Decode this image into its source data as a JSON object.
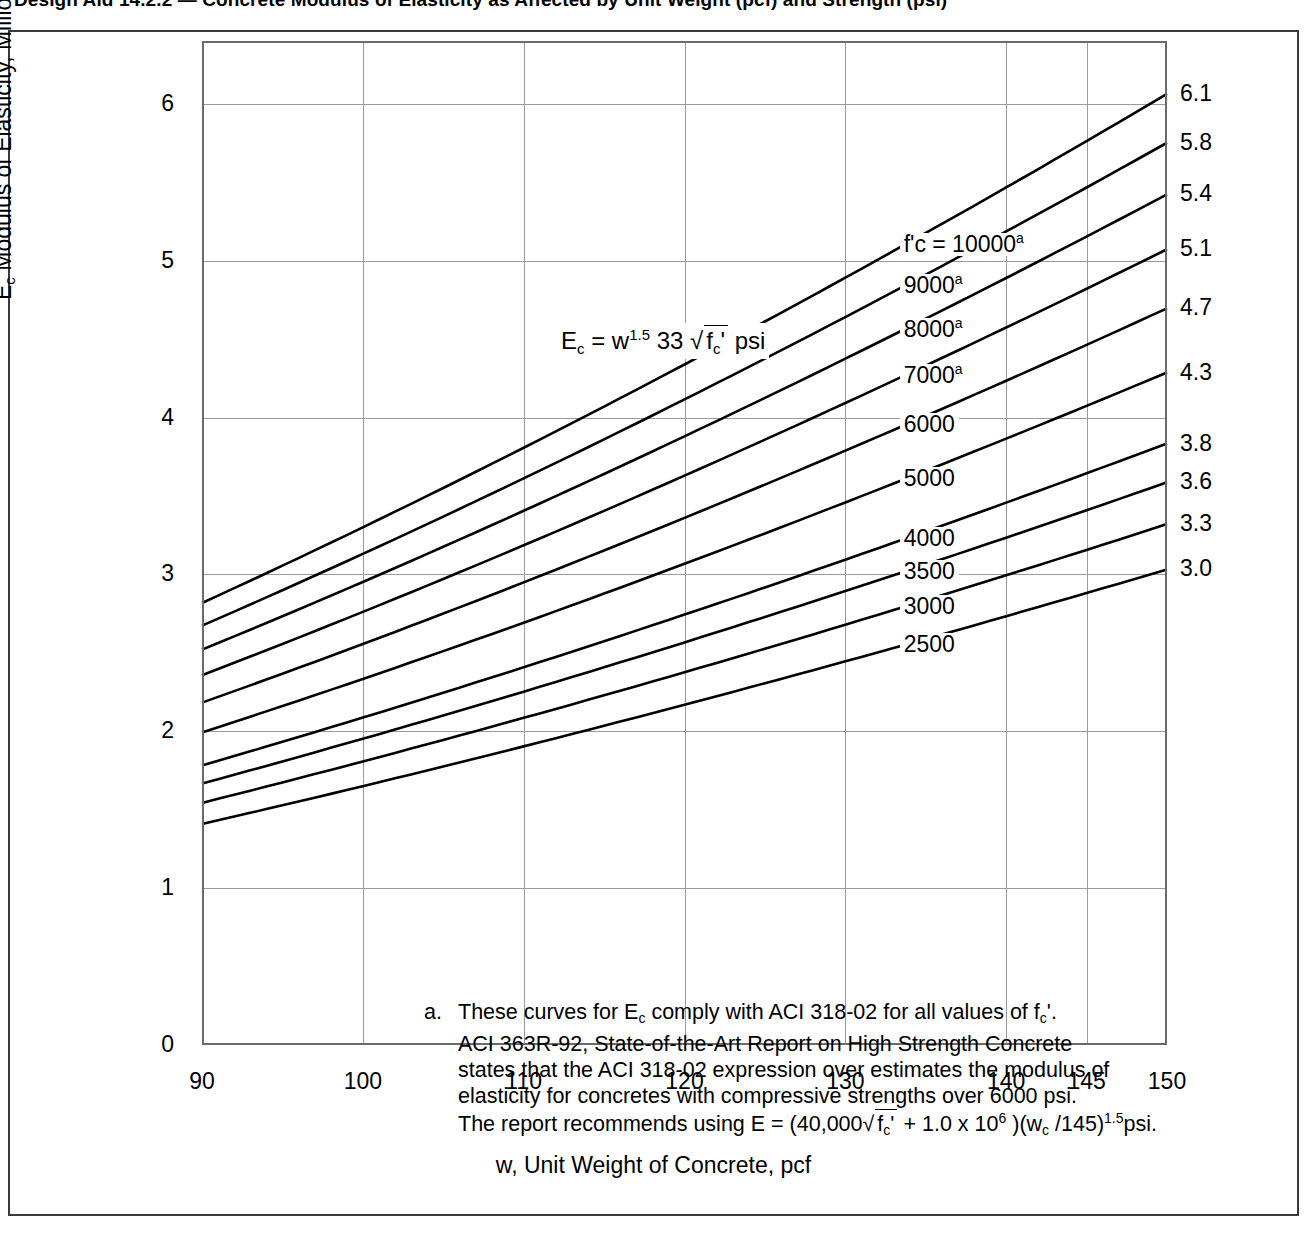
{
  "title": "Design Aid 14.2.2 — Concrete Modulus of Elasticity as Affected by Unit Weight (pcf) and Strength (psi)",
  "axes": {
    "xlabel": "w, Unit Weight of Concrete, pcf",
    "ylabel_prefix": "E",
    "ylabel_sub": "c",
    "ylabel_rest": "  Modulus of Elasticity, Million psi"
  },
  "equation": {
    "lhs": "E",
    "lhs_sub": "c",
    "eq": " = w",
    "w_exp": "1.5",
    "coef": " 33 ",
    "radicand_f": "f",
    "radicand_sub": "c",
    "radicand_prime": "'",
    "units": " psi"
  },
  "footnote": {
    "marker": "a.",
    "line1a": "These curves for E",
    "line1sub": "c",
    "line1b": " comply with ACI 318-02 for all values of f",
    "line1sub2": "c",
    "line1c": "'.",
    "line2": "ACI 363R-92, State-of-the-Art Report on High Strength Concrete",
    "line3": "states that the ACI 318-02 expression over estimates the modulus of",
    "line4": "elasticity for concretes with compressive strengths over 6000 psi.",
    "line5a": "The report recommends using E = (40,000",
    "line5f": "f",
    "line5fsub": "c",
    "line5fprime": "'",
    "line5b": " + 1.0 x 10",
    "line5exp": "6",
    "line5c": " )(w",
    "line5wsub": "c",
    "line5d": " /145)",
    "line5exp2": "1.5",
    "line5e": "psi."
  },
  "chart_data": {
    "type": "line",
    "title": "Concrete Modulus of Elasticity as Affected by Unit Weight (pcf) and Strength (psi)",
    "xlabel": "w, Unit Weight of Concrete, pcf",
    "ylabel": "Ec  Modulus of Elasticity, Million psi",
    "xlim": [
      90,
      150
    ],
    "ylim": [
      0,
      6.4
    ],
    "grid": true,
    "legend_position": "inline-right",
    "xticks": [
      90,
      100,
      110,
      120,
      130,
      140,
      145,
      150
    ],
    "xtick_labels": [
      "90",
      "100",
      "110",
      "120",
      "130",
      "140",
      "145",
      "150"
    ],
    "yticks": [
      0,
      1,
      2,
      3,
      4,
      5,
      6
    ],
    "ytick_labels": [
      "0",
      "1",
      "2",
      "3",
      "4",
      "5",
      "6"
    ],
    "formula": "Ec = w^1.5 * 33 * sqrt(f'c) psi",
    "x": [
      90,
      100,
      110,
      120,
      130,
      140,
      145,
      150
    ],
    "series": [
      {
        "name": "10000",
        "fc": 10000,
        "footnote": "a",
        "label": "f'c = 10000",
        "values": [
          2.82,
          3.3,
          3.81,
          4.34,
          4.89,
          5.47,
          5.76,
          6.06
        ],
        "end_value": "6.1"
      },
      {
        "name": "9000",
        "fc": 9000,
        "footnote": "a",
        "label": "9000",
        "values": [
          2.67,
          3.13,
          3.61,
          4.12,
          4.64,
          5.19,
          5.47,
          5.75
        ],
        "end_value": "5.8"
      },
      {
        "name": "8000",
        "fc": 8000,
        "footnote": "a",
        "label": "8000",
        "values": [
          2.52,
          2.95,
          3.41,
          3.88,
          4.38,
          4.89,
          5.15,
          5.42
        ],
        "end_value": "5.4"
      },
      {
        "name": "7000",
        "fc": 7000,
        "footnote": "a",
        "label": "7000",
        "values": [
          2.36,
          2.76,
          3.19,
          3.63,
          4.09,
          4.58,
          4.82,
          5.07
        ],
        "end_value": "5.1"
      },
      {
        "name": "6000",
        "fc": 6000,
        "footnote": "",
        "label": "6000",
        "values": [
          2.18,
          2.56,
          2.95,
          3.36,
          3.79,
          4.24,
          4.46,
          4.69
        ],
        "end_value": "4.7"
      },
      {
        "name": "5000",
        "fc": 5000,
        "footnote": "",
        "label": "5000",
        "values": [
          1.99,
          2.33,
          2.69,
          3.07,
          3.46,
          3.87,
          4.07,
          4.28
        ],
        "end_value": "4.3"
      },
      {
        "name": "4000",
        "fc": 4000,
        "footnote": "",
        "label": "4000",
        "values": [
          1.78,
          2.09,
          2.41,
          2.74,
          3.09,
          3.46,
          3.64,
          3.83
        ],
        "end_value": "3.8"
      },
      {
        "name": "3500",
        "fc": 3500,
        "footnote": "",
        "label": "3500",
        "values": [
          1.67,
          1.95,
          2.25,
          2.57,
          2.89,
          3.24,
          3.41,
          3.58
        ],
        "end_value": "3.6"
      },
      {
        "name": "3000",
        "fc": 3000,
        "footnote": "",
        "label": "3000",
        "values": [
          1.54,
          1.81,
          2.09,
          2.38,
          2.68,
          3.0,
          3.15,
          3.32
        ],
        "end_value": "3.3"
      },
      {
        "name": "2500",
        "fc": 2500,
        "footnote": "",
        "label": "2500",
        "values": [
          1.41,
          1.65,
          1.9,
          2.17,
          2.45,
          2.74,
          2.88,
          3.03
        ],
        "end_value": "3.0"
      }
    ]
  }
}
